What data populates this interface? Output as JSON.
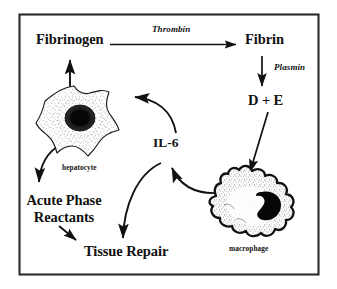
{
  "figure": {
    "background_color": "#ffffff",
    "ink_color": "#111111",
    "frame": {
      "name": "diagram-border",
      "color": "#2b2b2b",
      "x": 19,
      "y": 14,
      "width": 300,
      "height": 261
    }
  },
  "nodes": {
    "fibrinogen": {
      "label": "Fibrinogen",
      "x": 36,
      "y": 38
    },
    "fibrin": {
      "label": "Fibrin",
      "x": 245,
      "y": 38
    },
    "d_plus_e": {
      "label": "D + E",
      "x": 250,
      "y": 99
    },
    "il6": {
      "label": "IL-6",
      "x": 157,
      "y": 142
    },
    "acute_phase_reactants": {
      "label": "Acute Phase\nReactants",
      "line1": "Acute Phase",
      "line2": "Reactants",
      "x": 18,
      "y": 196
    },
    "tissue_repair": {
      "label": "Tissue Repair",
      "x": 84,
      "y": 249
    }
  },
  "enzymes": {
    "thrombin": {
      "label": "Thrombin",
      "x": 152,
      "y": 29
    },
    "plasmin": {
      "label": "Plasmin",
      "x": 277,
      "y": 66
    }
  },
  "cells": {
    "hepatocyte": {
      "caption": "hepatocyte",
      "caption_x": 62,
      "caption_y": 168,
      "shape": "stellate-polygon",
      "nucleus": "round-dark",
      "fill": "#ffffff",
      "stipple_color": "#2a2a2a"
    },
    "macrophage": {
      "caption": "macrophage",
      "caption_x": 229,
      "caption_y": 249,
      "shape": "ruffled-amoeboid",
      "nucleus": "kidney-dark",
      "fill": "#ffffff",
      "stipple_color": "#2a2a2a"
    }
  },
  "arrows": [
    {
      "name": "arrow-fibrinogen-to-fibrin",
      "from": "fibrinogen",
      "to": "fibrin",
      "enzyme": "thrombin",
      "style": "straight-horizontal"
    },
    {
      "name": "arrow-fibrin-to-d-plus-e",
      "from": "fibrin",
      "to": "d_plus_e",
      "enzyme": "plasmin",
      "style": "straight-vertical"
    },
    {
      "name": "arrow-d-plus-e-to-macrophage",
      "from": "d_plus_e",
      "to": "macrophage",
      "style": "straight-diagonal"
    },
    {
      "name": "arrow-macrophage-to-il6-up",
      "from": "macrophage",
      "to": "il6",
      "style": "curved"
    },
    {
      "name": "arrow-il6-to-hepatocyte",
      "from": "il6",
      "to": "hepatocyte",
      "style": "curved"
    },
    {
      "name": "arrow-hepatocyte-to-fibrinogen",
      "from": "hepatocyte",
      "to": "fibrinogen",
      "style": "straight-vertical"
    },
    {
      "name": "arrow-hepatocyte-to-acute-phase",
      "from": "hepatocyte",
      "to": "acute_phase_reactants",
      "style": "curved"
    },
    {
      "name": "arrow-acute-phase-to-tissue-repair",
      "from": "acute_phase_reactants",
      "to": "tissue_repair",
      "style": "short-diagonal"
    },
    {
      "name": "arrow-il6-to-tissue-repair",
      "from": "il6",
      "to": "tissue_repair",
      "style": "curved"
    }
  ]
}
